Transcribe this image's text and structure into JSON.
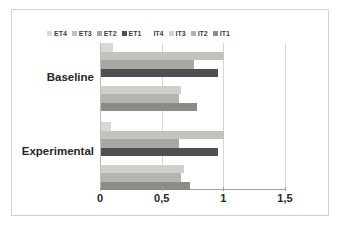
{
  "chart_data": {
    "type": "bar",
    "orientation": "horizontal",
    "title": "",
    "xlabel": "",
    "ylabel": "",
    "xlim": [
      0,
      1.5
    ],
    "grid": true,
    "legend_position": "top",
    "categories": [
      "Baseline",
      "Experimental"
    ],
    "xticks": [
      "0",
      "0,5",
      "1",
      "1,5"
    ],
    "xtick_values": [
      0,
      0.5,
      1,
      1.5
    ],
    "series": [
      {
        "name": "ET4",
        "color": "#d9d9d4",
        "values": [
          0.1,
          0.08
        ]
      },
      {
        "name": "ET3",
        "color": "#c3c3bd",
        "values": [
          1.0,
          1.0
        ]
      },
      {
        "name": "ET2",
        "color": "#a8a8a2",
        "values": [
          0.75,
          0.63
        ]
      },
      {
        "name": "ET1",
        "color": "#4f4f4f",
        "values": [
          0.95,
          0.95
        ]
      },
      {
        "name": "IT4",
        "color": "#ffffff",
        "values": [
          0.0,
          0.0
        ]
      },
      {
        "name": "IT3",
        "color": "#d0d0ca",
        "values": [
          0.65,
          0.67
        ]
      },
      {
        "name": "IT2",
        "color": "#b5b5b0",
        "values": [
          0.63,
          0.65
        ]
      },
      {
        "name": "IT1",
        "color": "#8c8c87",
        "values": [
          0.78,
          0.72
        ]
      }
    ],
    "legend_entries": [
      "ET4",
      "ET3",
      "ET2",
      "ET1",
      "IT4",
      "IT3",
      "IT2",
      "IT1"
    ]
  }
}
